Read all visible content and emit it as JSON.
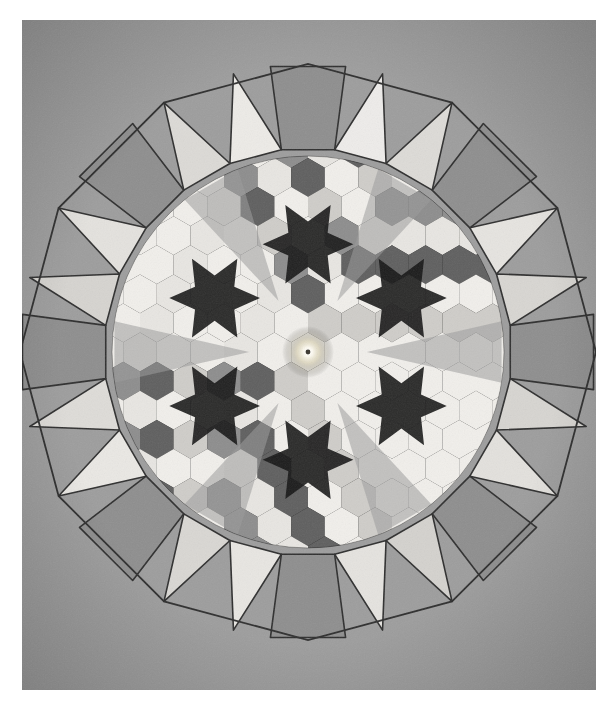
{
  "artwork": {
    "title": "Dodecagonal geometric mosaic",
    "medium_note": "photograph of tiled panel on gray paper ground",
    "canvas": {
      "width": 616,
      "height": 712,
      "background": "#ffffff"
    },
    "paper": {
      "x": 22,
      "y": 20,
      "width": 574,
      "height": 670,
      "color": "#9d9d9d"
    },
    "center": {
      "x": 308,
      "y": 352
    },
    "geometry": {
      "outer_shape": "dodecagon",
      "outer_radius": 288,
      "ring_tiles": 24,
      "hex_pitch": 33.6,
      "inner_field_radius": 196,
      "glow_radius": 26
    },
    "palette": {
      "paper": "#9d9d9d",
      "ink": "#2b2b2b",
      "near_black": "#151515",
      "dark": "#262626",
      "mid_dark": "#4a4a4a",
      "mid": "#8a8a8a",
      "mid_light": "#a8a8a8",
      "light": "#c9c9c9",
      "lighter": "#dcdcdc",
      "near_white": "#ececec",
      "white": "#f4f2ee",
      "glow": "#fffdf5"
    },
    "ring": {
      "square_fill": "#8e8e8e",
      "triangle_fill_light": "#d2d2d2",
      "triangle_fill_lighter": "#e2e0dc",
      "triangle_fill_pale": "#efeeea",
      "stroke": "#2e2e2e",
      "stroke_width": 1.6,
      "tiles": [
        {
          "index": 0,
          "kind": "square",
          "angle": 0,
          "fill": "#8e8e8e",
          "label": "ring-square-east"
        },
        {
          "index": 1,
          "kind": "triangle",
          "angle": 15,
          "fill": "#d8d6d2",
          "label": "ring-triangle"
        },
        {
          "index": 2,
          "kind": "triangle",
          "angle": 30,
          "fill": "#e6e4e0",
          "label": "ring-triangle"
        },
        {
          "index": 3,
          "kind": "square",
          "angle": 45,
          "fill": "#8e8e8e",
          "label": "ring-square"
        },
        {
          "index": 4,
          "kind": "triangle",
          "angle": 60,
          "fill": "#dddbd7",
          "label": "ring-triangle"
        },
        {
          "index": 5,
          "kind": "triangle",
          "angle": 75,
          "fill": "#eeeceA",
          "label": "ring-triangle"
        },
        {
          "index": 6,
          "kind": "square",
          "angle": 90,
          "fill": "#8e8e8e",
          "label": "ring-square-north"
        },
        {
          "index": 7,
          "kind": "triangle",
          "angle": 105,
          "fill": "#edebe7",
          "label": "ring-triangle"
        },
        {
          "index": 8,
          "kind": "triangle",
          "angle": 120,
          "fill": "#dcdad6",
          "label": "ring-triangle"
        },
        {
          "index": 9,
          "kind": "square",
          "angle": 135,
          "fill": "#8e8e8e",
          "label": "ring-square"
        },
        {
          "index": 10,
          "kind": "triangle",
          "angle": 150,
          "fill": "#e4e2de",
          "label": "ring-triangle"
        },
        {
          "index": 11,
          "kind": "triangle",
          "angle": 165,
          "fill": "#d6d4d0",
          "label": "ring-triangle"
        },
        {
          "index": 12,
          "kind": "square",
          "angle": 180,
          "fill": "#8e8e8e",
          "label": "ring-square-west"
        },
        {
          "index": 13,
          "kind": "triangle",
          "angle": 195,
          "fill": "#dedcd8",
          "label": "ring-triangle"
        },
        {
          "index": 14,
          "kind": "triangle",
          "angle": 210,
          "fill": "#eae8e4",
          "label": "ring-triangle"
        },
        {
          "index": 15,
          "kind": "square",
          "angle": 225,
          "fill": "#8e8e8e",
          "label": "ring-square"
        },
        {
          "index": 16,
          "kind": "triangle",
          "angle": 240,
          "fill": "#d9d7d3",
          "label": "ring-triangle"
        },
        {
          "index": 17,
          "kind": "triangle",
          "angle": 255,
          "fill": "#e8e6e2",
          "label": "ring-triangle"
        },
        {
          "index": 18,
          "kind": "square",
          "angle": 270,
          "fill": "#8e8e8e",
          "label": "ring-square-south"
        },
        {
          "index": 19,
          "kind": "triangle",
          "angle": 285,
          "fill": "#e5e3df",
          "label": "ring-triangle"
        },
        {
          "index": 20,
          "kind": "triangle",
          "angle": 300,
          "fill": "#d4d2ce",
          "label": "ring-triangle"
        },
        {
          "index": 21,
          "kind": "square",
          "angle": 315,
          "fill": "#8e8e8e",
          "label": "ring-square"
        },
        {
          "index": 22,
          "kind": "triangle",
          "angle": 330,
          "fill": "#e3e1dd",
          "label": "ring-triangle"
        },
        {
          "index": 23,
          "kind": "triangle",
          "angle": 345,
          "fill": "#d7d5d1",
          "label": "ring-triangle"
        }
      ]
    },
    "inner_field": {
      "background": "#171717",
      "description": "hexagons on a triangular lattice separated by dark triangles forming six-pointed stars",
      "hex_fills": [
        "#f1efeb",
        "#8d8d8d",
        "#e8e6e2",
        "#5f5f5f",
        "#cfcdc9",
        "#7a7a7a"
      ],
      "star_fill": "#151515",
      "wedge_fill": "#9a9a9a"
    },
    "glow": {
      "core": "#ffffff",
      "halo": "#d8cfae",
      "pupil": "#3a3630",
      "label": "central-light-glow"
    }
  }
}
